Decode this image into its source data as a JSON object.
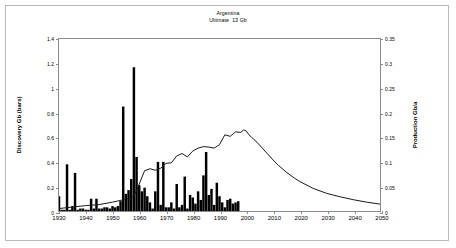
{
  "title": {
    "line1": "Argentina",
    "line2": "Ultimate  13 Gb"
  },
  "chart_data": {
    "type": "bar",
    "title": "Argentina",
    "subtitle": "Ultimate  13 Gb",
    "xlabel": "",
    "ylabel": "Discovery Gb (bars)",
    "y2label": "Production Gb/a",
    "xlim": [
      1930,
      2050
    ],
    "ylim": [
      0,
      1.4
    ],
    "y2lim": [
      0,
      0.35
    ],
    "grid": false,
    "legend": false,
    "xticks": [
      1930,
      1940,
      1950,
      1960,
      1970,
      1980,
      1990,
      2000,
      2010,
      2020,
      2030,
      2040,
      2050
    ],
    "yticks": [
      0,
      0.2,
      0.4,
      0.6,
      0.8,
      1.0,
      1.2,
      1.4
    ],
    "yticklabels": [
      "0",
      "0.2",
      "0.4",
      "0.6",
      "0.8",
      "1",
      "1.2",
      "1.4"
    ],
    "y2ticks": [
      0,
      0.05,
      0.1,
      0.15,
      0.2,
      0.25,
      0.3,
      0.35
    ],
    "y2ticklabels": [
      "0",
      "0.05",
      "0.1",
      "0.15",
      "0.2",
      "0.25",
      "0.3",
      "0.35"
    ],
    "series": [
      {
        "name": "Discovery Gb (bars)",
        "type": "bar",
        "axis": "left",
        "color": "#000000",
        "x": [
          1930,
          1931,
          1932,
          1933,
          1934,
          1935,
          1936,
          1937,
          1938,
          1939,
          1940,
          1941,
          1942,
          1943,
          1944,
          1945,
          1946,
          1947,
          1948,
          1949,
          1950,
          1951,
          1952,
          1953,
          1954,
          1955,
          1956,
          1957,
          1958,
          1959,
          1960,
          1961,
          1962,
          1963,
          1964,
          1965,
          1966,
          1967,
          1968,
          1969,
          1970,
          1971,
          1972,
          1973,
          1974,
          1975,
          1976,
          1977,
          1978,
          1979,
          1980,
          1981,
          1982,
          1983,
          1984,
          1985,
          1986,
          1987,
          1988,
          1989,
          1990,
          1991,
          1992,
          1993,
          1994,
          1995,
          1996,
          1997
        ],
        "values": [
          0.12,
          0.01,
          0.01,
          0.38,
          0.01,
          0.04,
          0.31,
          0.01,
          0.02,
          0.02,
          0.01,
          0.01,
          0.1,
          0.02,
          0.1,
          0.02,
          0.02,
          0.03,
          0.03,
          0.02,
          0.04,
          0.03,
          0.04,
          0.08,
          0.85,
          0.14,
          0.17,
          0.26,
          1.17,
          0.44,
          0.21,
          0.16,
          0.19,
          0.12,
          0.07,
          0.02,
          0.16,
          0.4,
          0.05,
          0.4,
          0.03,
          0.03,
          0.07,
          0.02,
          0.22,
          0.03,
          0.05,
          0.28,
          0.02,
          0.13,
          0.11,
          0.06,
          0.16,
          0.09,
          0.29,
          0.48,
          0.13,
          0.18,
          0.05,
          0.23,
          0.12,
          0.07,
          0.03,
          0.09,
          0.1,
          0.06,
          0.07,
          0.08
        ]
      },
      {
        "name": "Production Gb/a",
        "type": "line",
        "axis": "right",
        "color": "#1a1a1a",
        "x": [
          1930,
          1935,
          1940,
          1945,
          1950,
          1955,
          1958,
          1960,
          1962,
          1964,
          1966,
          1968,
          1970,
          1972,
          1974,
          1976,
          1978,
          1980,
          1982,
          1984,
          1986,
          1988,
          1990,
          1992,
          1994,
          1996,
          1998,
          1999,
          2000,
          2001,
          2002,
          2004,
          2006,
          2008,
          2010,
          2012,
          2015,
          2018,
          2020,
          2025,
          2030,
          2035,
          2040,
          2045,
          2050
        ],
        "values": [
          0.005,
          0.008,
          0.011,
          0.013,
          0.018,
          0.024,
          0.03,
          0.055,
          0.082,
          0.086,
          0.083,
          0.087,
          0.097,
          0.098,
          0.112,
          0.117,
          0.11,
          0.122,
          0.128,
          0.131,
          0.13,
          0.128,
          0.135,
          0.155,
          0.152,
          0.161,
          0.16,
          0.165,
          0.163,
          0.155,
          0.15,
          0.14,
          0.128,
          0.116,
          0.104,
          0.093,
          0.079,
          0.067,
          0.06,
          0.046,
          0.036,
          0.029,
          0.023,
          0.018,
          0.014
        ]
      }
    ]
  }
}
